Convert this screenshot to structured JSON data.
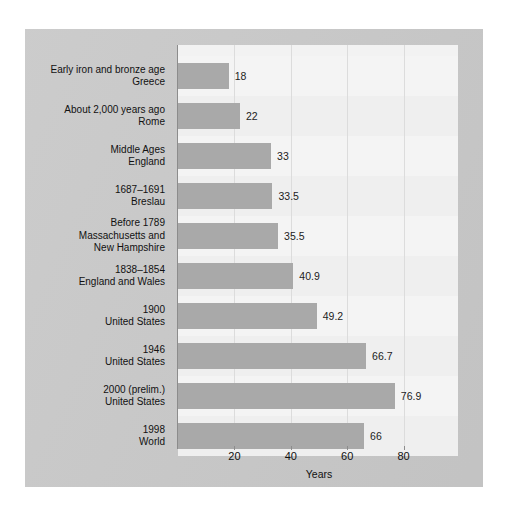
{
  "chart_data": {
    "type": "bar",
    "orientation": "horizontal",
    "title": "",
    "subtitle": "",
    "xlabel": "Years",
    "ylabel": "",
    "xlim": [
      0,
      100
    ],
    "xticks": [
      20,
      40,
      60,
      80
    ],
    "grid": "vertical",
    "legend": "none",
    "bar_color": "#a9a9a9",
    "plot_background": "#f2f2f2",
    "panel_background": "#c9c9c9",
    "categories": [
      "Early iron and bronze age\nGreece",
      "About 2,000 years ago\nRome",
      "Middle Ages\nEngland",
      "1687–1691\nBreslau",
      "Before 1789\nMassachusetts and\nNew Hampshire",
      "1838–1854\nEngland and Wales",
      "1900\nUnited States",
      "1946\nUnited States",
      "2000 (prelim.)\nUnited States",
      "1998\nWorld"
    ],
    "values": [
      18,
      22,
      33,
      33.5,
      35.5,
      40.9,
      49.2,
      66.7,
      76.9,
      66
    ],
    "value_labels": [
      "18",
      "22",
      "33",
      "33.5",
      "35.5",
      "40.9",
      "49.2",
      "66.7",
      "76.9",
      "66"
    ]
  }
}
